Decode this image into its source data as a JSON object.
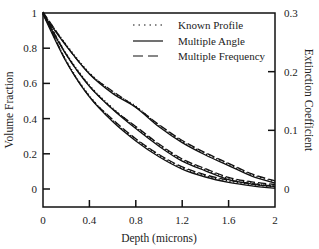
{
  "chart_data": {
    "type": "line",
    "title": "",
    "xlabel": "Depth (microns)",
    "ylabel": "Volume Fraction",
    "y2label": "Extinction Coefficient",
    "xlim": [
      0,
      2
    ],
    "ylim": [
      0,
      1
    ],
    "y2lim": [
      0,
      0.3
    ],
    "x_ticks": [
      "0",
      "0.4",
      "0.8",
      "1.2",
      "1.6",
      "2"
    ],
    "y_ticks": [
      "0",
      "0.2",
      "0.4",
      "0.6",
      "0.8",
      "1"
    ],
    "y2_ticks": [
      "0",
      "0.1",
      "0.2",
      "0.3"
    ],
    "grid": false,
    "legend_position": "upper right",
    "legend": [
      {
        "name": "Known Profile",
        "style": "dotted"
      },
      {
        "name": "Multiple Angle",
        "style": "solid"
      },
      {
        "name": "Multiple Frequency",
        "style": "dashed"
      }
    ],
    "x": [
      0,
      0.2,
      0.4,
      0.6,
      0.8,
      1.0,
      1.2,
      1.4,
      1.6,
      1.8,
      2.0
    ],
    "profiles": [
      {
        "name": "Profile A (upper)",
        "series": [
          {
            "name": "Known Profile",
            "values": [
              1.0,
              0.82,
              0.66,
              0.55,
              0.47,
              0.36,
              0.27,
              0.2,
              0.14,
              0.08,
              0.04
            ]
          },
          {
            "name": "Multiple Angle",
            "values": [
              1.0,
              0.82,
              0.66,
              0.55,
              0.47,
              0.36,
              0.27,
              0.2,
              0.14,
              0.08,
              0.04
            ]
          },
          {
            "name": "Multiple Frequency",
            "values": [
              1.0,
              0.81,
              0.65,
              0.55,
              0.46,
              0.36,
              0.27,
              0.2,
              0.14,
              0.08,
              0.04
            ]
          }
        ]
      },
      {
        "name": "Profile B (middle)",
        "series": [
          {
            "name": "Known Profile",
            "values": [
              1.0,
              0.77,
              0.59,
              0.46,
              0.35,
              0.25,
              0.165,
              0.11,
              0.06,
              0.035,
              0.02
            ]
          },
          {
            "name": "Multiple Angle",
            "values": [
              1.0,
              0.77,
              0.59,
              0.46,
              0.35,
              0.25,
              0.165,
              0.11,
              0.06,
              0.035,
              0.02
            ]
          },
          {
            "name": "Multiple Frequency",
            "values": [
              1.0,
              0.76,
              0.58,
              0.45,
              0.35,
              0.25,
              0.165,
              0.11,
              0.06,
              0.035,
              0.02
            ]
          }
        ]
      },
      {
        "name": "Profile C (lower)",
        "series": [
          {
            "name": "Known Profile",
            "values": [
              1.0,
              0.73,
              0.53,
              0.39,
              0.28,
              0.19,
              0.12,
              0.075,
              0.045,
              0.025,
              0.01
            ]
          },
          {
            "name": "Multiple Angle",
            "values": [
              1.0,
              0.73,
              0.53,
              0.39,
              0.28,
              0.19,
              0.12,
              0.075,
              0.045,
              0.025,
              0.01
            ]
          },
          {
            "name": "Multiple Frequency",
            "values": [
              1.0,
              0.72,
              0.52,
              0.39,
              0.28,
              0.19,
              0.12,
              0.075,
              0.045,
              0.025,
              0.01
            ]
          }
        ]
      }
    ]
  }
}
